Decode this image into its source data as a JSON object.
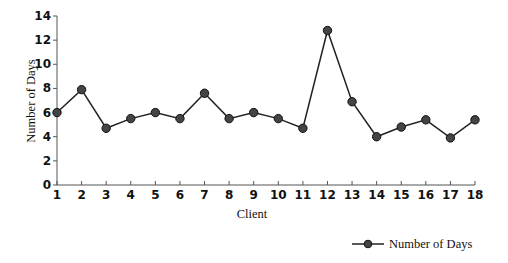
{
  "chart_data": {
    "type": "line",
    "title": "",
    "xlabel": "Client",
    "ylabel": "Number of Days",
    "categories": [
      "1",
      "2",
      "3",
      "4",
      "5",
      "6",
      "7",
      "8",
      "9",
      "10",
      "11",
      "12",
      "13",
      "14",
      "15",
      "16",
      "17",
      "18"
    ],
    "series": [
      {
        "name": "Number of Days",
        "values": [
          6.0,
          7.9,
          4.7,
          5.5,
          6.0,
          5.5,
          7.6,
          5.5,
          6.0,
          5.5,
          4.7,
          12.8,
          6.9,
          4.0,
          4.8,
          5.4,
          3.9,
          5.4
        ]
      }
    ],
    "ylim": [
      0,
      14
    ],
    "yticks": [
      0,
      2,
      4,
      6,
      8,
      10,
      12,
      14
    ],
    "grid": false,
    "legend_position": "bottom-right"
  },
  "legend": {
    "label": "Number of Days"
  },
  "colors": {
    "line": "#222222",
    "marker": "#444444"
  }
}
